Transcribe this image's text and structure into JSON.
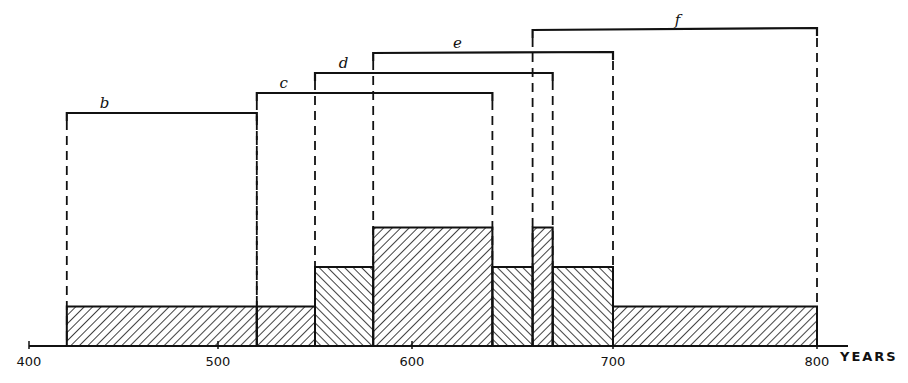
{
  "chart_data": {
    "type": "bar",
    "subtype": "stacked-interval-histogram",
    "title": "",
    "xlabel": "YEARS",
    "ylabel": "",
    "xlim": [
      400,
      800
    ],
    "x_ticks": [
      "400",
      "500",
      "600",
      "700",
      "800"
    ],
    "grid": false,
    "legend": null,
    "intervals": [
      {
        "label": "b",
        "start": 420,
        "end": 520
      },
      {
        "label": "c",
        "start": 520,
        "end": 640
      },
      {
        "label": "d",
        "start": 550,
        "end": 670
      },
      {
        "label": "e",
        "start": 580,
        "end": 700
      },
      {
        "label": "f",
        "start": 660,
        "end": 800
      }
    ],
    "histogram": [
      {
        "start": 420,
        "end": 520,
        "count": 1,
        "hatch": "fwd"
      },
      {
        "start": 520,
        "end": 550,
        "count": 1,
        "hatch": "fwd"
      },
      {
        "start": 550,
        "end": 580,
        "count": 2,
        "hatch": "back"
      },
      {
        "start": 580,
        "end": 640,
        "count": 3,
        "hatch": "fwd"
      },
      {
        "start": 640,
        "end": 660,
        "count": 2,
        "hatch": "back"
      },
      {
        "start": 660,
        "end": 670,
        "count": 3,
        "hatch": "fwd"
      },
      {
        "start": 670,
        "end": 700,
        "count": 2,
        "hatch": "back"
      },
      {
        "start": 700,
        "end": 800,
        "count": 1,
        "hatch": "fwd"
      }
    ]
  }
}
